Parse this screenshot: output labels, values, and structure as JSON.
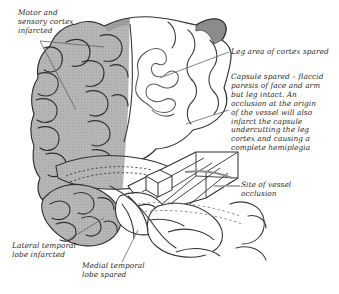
{
  "figure": {
    "kind": "medical-illustration",
    "background_color": "#ffffff",
    "ink_color": "#2b2b2b",
    "infarct_fill": "#b2b2b2",
    "infarct_fill_dark": "#9a9a9a",
    "spared_fill": "#ffffff"
  },
  "labels": {
    "motor_sensory": "Motor and\nsensory cortex\ninfarcted",
    "leg_area": "Leg area of cortex spared",
    "capsule": "Capsule spared – flaccid\nparesis of face and arm\nbut leg intact. An\nocclusion at the origin\nof the vessel will also\ninfarct the capsule\nundercutting the leg\ncortex and causing a\ncomplete hemiplegia",
    "site_of_vessel": "Site of vessel\nocclusion",
    "lateral_temporal": "Lateral temporal\nlobe infarcted",
    "medial_temporal": "Medial temporal\nlobe spared"
  }
}
